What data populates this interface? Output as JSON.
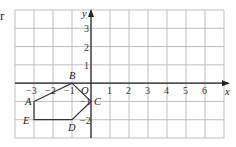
{
  "cropped_text": "r",
  "chart_data": {
    "type": "scatter",
    "title": "",
    "xlabel": "x",
    "ylabel": "y",
    "xlim": [
      -4,
      7
    ],
    "ylim": [
      -3,
      4
    ],
    "grid": true,
    "x_ticks": [
      "-3",
      "-2",
      "-1",
      "1",
      "2",
      "3",
      "4",
      "5",
      "6"
    ],
    "y_ticks": [
      "3",
      "2",
      "1",
      "-1",
      "-2"
    ],
    "origin_label": "O",
    "polygon": {
      "name": "ABCDE",
      "closed": true,
      "points": [
        {
          "label": "A",
          "x": -3,
          "y": -1
        },
        {
          "label": "B",
          "x": -1,
          "y": 0
        },
        {
          "label": "C",
          "x": 0,
          "y": -1
        },
        {
          "label": "D",
          "x": -1,
          "y": -2
        },
        {
          "label": "E",
          "x": -3,
          "y": -2
        }
      ]
    }
  },
  "colors": {
    "grid": "#b8b8b8",
    "axis": "#222222",
    "polygon": "#333333"
  }
}
